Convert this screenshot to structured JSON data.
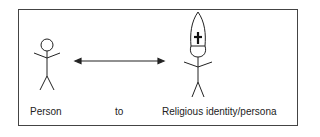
{
  "diagram": {
    "labels": {
      "left": "Person",
      "middle": "to",
      "right": "Religious identity/persona"
    },
    "icons": {
      "left_figure": "stick-figure-person",
      "arrow": "double-headed-arrow",
      "right_figure": "stick-figure-with-mitre-and-cross"
    },
    "colors": {
      "stroke": "#222222",
      "border": "#444444",
      "background": "#ffffff"
    }
  }
}
